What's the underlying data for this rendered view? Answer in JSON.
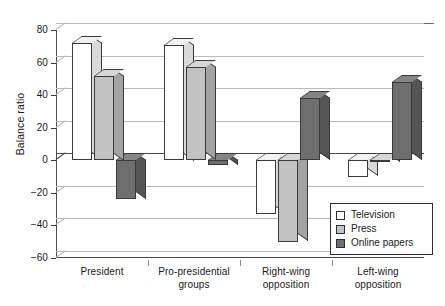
{
  "chart_data": {
    "type": "bar",
    "title": "",
    "subtitle": "",
    "xlabel": "",
    "ylabel": "Balance ratio",
    "ylim": [
      -60,
      80
    ],
    "yticks": [
      80,
      60,
      40,
      20,
      0,
      -20,
      -40,
      -60
    ],
    "ytick_labels": [
      "80",
      "60",
      "40",
      "20",
      "0",
      "−20",
      "−40",
      "−60"
    ],
    "grid": true,
    "legend_position": "lower-right",
    "style": "3d-column",
    "categories": [
      "President",
      "Pro-presidential groups",
      "Right-wing opposition",
      "Left-wing opposition"
    ],
    "category_lines": [
      [
        "President"
      ],
      [
        "Pro-presidential",
        "groups"
      ],
      [
        "Right-wing",
        "opposition"
      ],
      [
        "Left-wing",
        "opposition"
      ]
    ],
    "series": [
      {
        "name": "Television",
        "color": "#ffffff",
        "values": [
          72,
          71,
          -33,
          -10
        ]
      },
      {
        "name": "Press",
        "color": "#c2c2c2",
        "values": [
          52,
          57,
          -50,
          -1
        ]
      },
      {
        "name": "Online papers",
        "color": "#6e6e6e",
        "values": [
          -24,
          -3,
          38,
          48
        ]
      }
    ]
  },
  "legend": {
    "items": [
      {
        "label": "Television",
        "swatch": "sw-tv"
      },
      {
        "label": "Press",
        "swatch": "sw-press"
      },
      {
        "label": "Online papers",
        "swatch": "sw-online"
      }
    ]
  },
  "colors": {
    "television": "#ffffff",
    "press": "#c2c2c2",
    "online_papers": "#6e6e6e",
    "axis": "#3a3a3a",
    "grid": "#b9b9b9",
    "background": "#ffffff"
  }
}
